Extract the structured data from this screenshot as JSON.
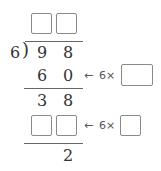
{
  "problem": {
    "divisor": "6",
    "dividend": [
      "9",
      "8"
    ],
    "quotient_boxes": [
      "",
      ""
    ],
    "step1": {
      "product": [
        "6",
        "0"
      ],
      "hint_arrow": "←",
      "hint_text": "6×",
      "hint_box": ""
    },
    "remainder1": [
      "3",
      "8"
    ],
    "step2": {
      "product_boxes": [
        "",
        ""
      ],
      "hint_arrow": "←",
      "hint_text": "6×",
      "hint_box": ""
    },
    "final_remainder": "2"
  }
}
